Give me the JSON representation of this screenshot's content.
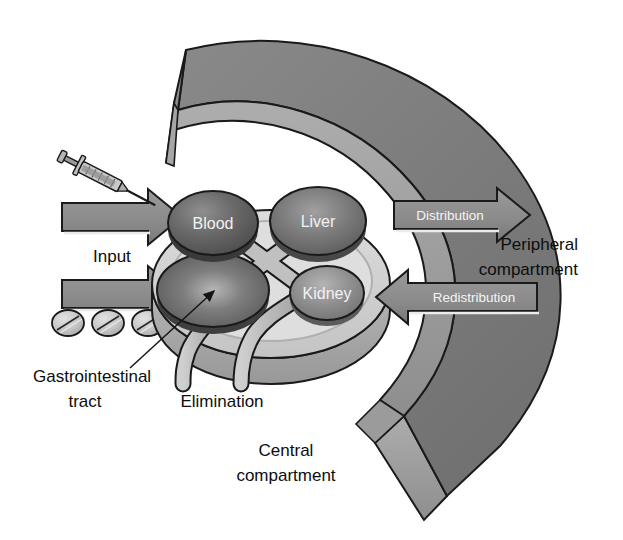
{
  "figure": {
    "background_color": "#ffffff",
    "outline_color": "#1a1a1a"
  },
  "colors": {
    "arc_top": "#7c7c7c",
    "arc_side": "#9d9d9d",
    "arc_inner_edge": "#8a8a8a",
    "disc_face": "#d4d4d4",
    "disc_rim": "#a8a8a8",
    "organ_dark": "#5b5b5b",
    "organ_mid": "#6e6e6e",
    "organ_light": "#8f8f8f",
    "tube": "#b9b9b9",
    "arrow_body": "#8d8d8d",
    "arrow_shade": "#6f6f6f",
    "pill": "#c9c9c9",
    "text_black": "#0d0d0d",
    "text_white": "#f4f4f4"
  },
  "central_compartment": {
    "label": "Central\ncompartment",
    "label_line1": "Central",
    "label_line2": "compartment",
    "organs": [
      {
        "name": "blood",
        "label": "Blood",
        "shade": "dark"
      },
      {
        "name": "liver",
        "label": "Liver",
        "shade": "mid"
      },
      {
        "name": "gastrointestinal-tract",
        "label": "",
        "shade": "dark"
      },
      {
        "name": "kidney",
        "label": "Kidney",
        "shade": "light"
      }
    ]
  },
  "peripheral_compartment": {
    "label_line1": "Peripheral",
    "label_line2": "compartment"
  },
  "flows": [
    {
      "name": "input",
      "label": "Input",
      "direction": "right",
      "style": "black-text"
    },
    {
      "name": "distribution",
      "label": "Distribution",
      "direction": "right",
      "style": "white-text"
    },
    {
      "name": "redistribution",
      "label": "Redistribution",
      "direction": "left",
      "style": "white-text"
    },
    {
      "name": "elimination",
      "label": "Elimination",
      "direction": "down",
      "style": "black-text"
    }
  ],
  "annotations": [
    {
      "name": "gastrointestinal-tract",
      "line1": "Gastrointestinal",
      "line2": "tract",
      "has_leader_line": true
    }
  ],
  "route_icons": [
    {
      "name": "syringe",
      "description": "injection syringe",
      "count": 1
    },
    {
      "name": "pill",
      "description": "oral tablet",
      "count": 3
    }
  ]
}
